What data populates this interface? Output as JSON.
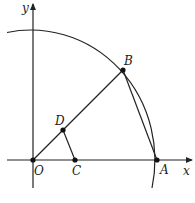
{
  "diagram": {
    "type": "geometry-figure",
    "axes": {
      "x_label": "x",
      "y_label": "y"
    },
    "points": {
      "O": {
        "label": "O",
        "x": 33,
        "y": 160
      },
      "A": {
        "label": "A",
        "x": 157,
        "y": 160
      },
      "B": {
        "label": "B",
        "x": 123,
        "y": 70
      },
      "C": {
        "label": "C",
        "x": 75,
        "y": 160
      },
      "D": {
        "label": "D",
        "x": 63,
        "y": 130
      }
    },
    "segments": [
      "OB",
      "AB",
      "DC"
    ],
    "arc": {
      "center": "O",
      "passes_through": [
        "A",
        "B"
      ]
    },
    "colors": {
      "stroke": "#222222",
      "background": "#ffffff"
    }
  }
}
